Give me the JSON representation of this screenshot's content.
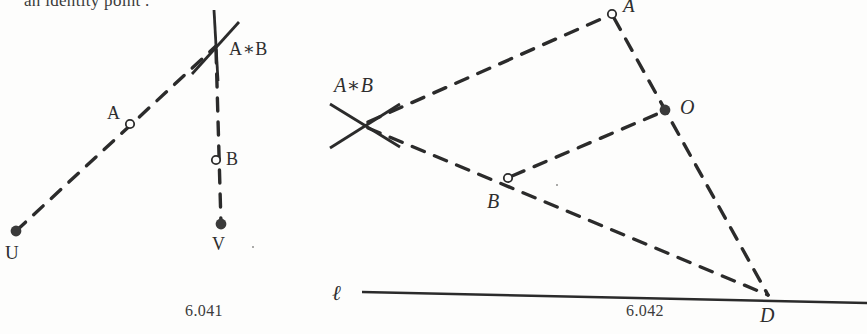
{
  "page": {
    "width": 867,
    "height": 334,
    "background_color": "#fdfdfc",
    "ink_color": "#2b2b2b",
    "clipped_header_text": "an identity point ."
  },
  "figures": [
    {
      "id": "fig-6041",
      "caption": "6.041",
      "caption_pos": {
        "x": 185,
        "y": 302
      },
      "points": [
        {
          "name": "U",
          "label": "U",
          "style": "filled",
          "label_style": "upright",
          "x": 16,
          "y": 231,
          "label_x": 5,
          "label_y": 243
        },
        {
          "name": "A",
          "label": "A",
          "style": "open",
          "label_style": "upright",
          "x": 130,
          "y": 124,
          "label_x": 107,
          "label_y": 104
        },
        {
          "name": "B",
          "label": "B",
          "style": "open",
          "label_style": "upright",
          "x": 216,
          "y": 160,
          "label_x": 226,
          "label_y": 150
        },
        {
          "name": "V",
          "label": "V",
          "style": "filled",
          "label_style": "upright",
          "x": 221,
          "y": 224,
          "label_x": 212,
          "label_y": 235
        },
        {
          "name": "AstarB",
          "label": "A∗B",
          "style": "cross",
          "label_style": "upright",
          "x": 216,
          "y": 46,
          "label_x": 229,
          "label_y": 40
        }
      ],
      "segments": [
        {
          "name": "U-to-AstarB",
          "from": [
            16,
            231
          ],
          "to": [
            216,
            46
          ],
          "dashed": true
        },
        {
          "name": "AstarB-to-V",
          "from": [
            216,
            50
          ],
          "to": [
            221,
            224
          ],
          "dashed": true
        }
      ],
      "cross_marks": [
        {
          "name": "cross-vertical",
          "from": [
            214,
            10
          ],
          "to": [
            218,
            81
          ]
        },
        {
          "name": "cross-diagonal",
          "from": [
            192,
            74
          ],
          "to": [
            239,
            22
          ]
        }
      ]
    },
    {
      "id": "fig-6042",
      "caption": "6.042",
      "caption_pos": {
        "x": 626,
        "y": 302
      },
      "line_label": "ℓ",
      "line_label_pos": {
        "x": 333,
        "y": 285
      },
      "baseline": {
        "name": "line-ell",
        "from": [
          362,
          292
        ],
        "to": [
          867,
          303
        ]
      },
      "points": [
        {
          "name": "A",
          "label": "A",
          "style": "open",
          "label_style": "italic",
          "x": 612,
          "y": 14,
          "label_x": 623,
          "label_y": -2
        },
        {
          "name": "B",
          "label": "B",
          "style": "open",
          "label_style": "italic",
          "x": 508,
          "y": 178,
          "label_x": 489,
          "label_y": 192
        },
        {
          "name": "O",
          "label": "O",
          "style": "filled",
          "label_style": "italic",
          "x": 665,
          "y": 110,
          "label_x": 680,
          "label_y": 97
        },
        {
          "name": "D",
          "label": "D",
          "style": "vertex",
          "label_style": "italic",
          "x": 768,
          "y": 297,
          "label_x": 761,
          "label_y": 306
        },
        {
          "name": "AstarB",
          "label": "A∗B",
          "style": "cross",
          "label_style": "italic",
          "x": 364,
          "y": 125,
          "label_x": 334,
          "label_y": 77
        }
      ],
      "segments": [
        {
          "name": "AstarB-to-A",
          "from": [
            368,
            122
          ],
          "to": [
            608,
            16
          ],
          "dashed": true
        },
        {
          "name": "AstarB-to-B-to-D",
          "from": [
            368,
            128
          ],
          "to": [
            768,
            295
          ],
          "dashed": true
        },
        {
          "name": "A-to-D",
          "from": [
            614,
            18
          ],
          "to": [
            768,
            295
          ],
          "dashed": true
        },
        {
          "name": "B-to-O",
          "from": [
            512,
            176
          ],
          "to": [
            662,
            112
          ],
          "dashed": true
        }
      ],
      "cross_marks": [
        {
          "name": "cross-diagonal-down",
          "from": [
            330,
            104
          ],
          "to": [
            400,
            147
          ]
        },
        {
          "name": "cross-diagonal-up",
          "from": [
            330,
            148
          ],
          "to": [
            400,
            104
          ]
        }
      ]
    }
  ]
}
